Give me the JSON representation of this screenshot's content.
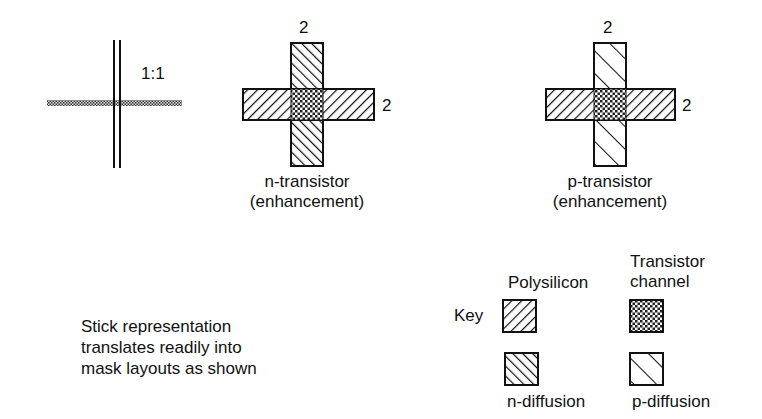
{
  "stick": {
    "ratio_label": "1:1"
  },
  "n_transistor": {
    "width_top": "2",
    "width_right": "2",
    "title_line1": "n-transistor",
    "title_line2": "(enhancement)"
  },
  "p_transistor": {
    "width_top": "2",
    "width_right": "2",
    "title_line1": "p-transistor",
    "title_line2": "(enhancement)"
  },
  "caption": {
    "line1": "Stick representation",
    "line2": "translates readily into",
    "line3": "mask layouts as shown"
  },
  "key": {
    "title": "Key",
    "items": [
      {
        "label": "Polysilicon",
        "pattern": "diagonal-backslash-dense"
      },
      {
        "label_line1": "Transistor",
        "label_line2": "channel",
        "pattern": "crosshatch"
      },
      {
        "label": "n-diffusion",
        "pattern": "diagonal-forward-dense"
      },
      {
        "label": "p-diffusion",
        "pattern": "diagonal-forward-sparse"
      }
    ]
  },
  "colors": {
    "ink": "#111111",
    "background": "#ffffff"
  }
}
